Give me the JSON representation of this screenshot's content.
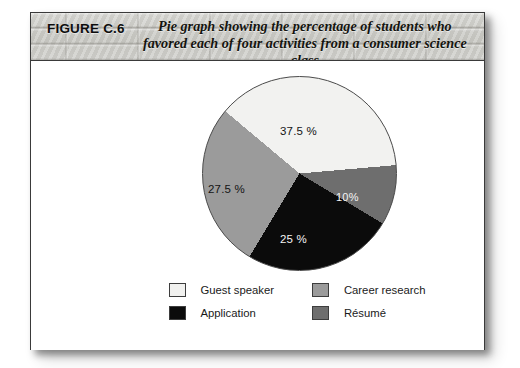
{
  "figure": {
    "number_label": "FIGURE C.6",
    "caption": "Pie graph showing the percentage of students who favored each of four activities from a consumer science class"
  },
  "chart_data": {
    "type": "pie",
    "title": "Pie graph showing the percentage of students who favored each of four activities from a consumer science class",
    "categories": [
      "Guest speaker",
      "Career research",
      "Application",
      "Résumé"
    ],
    "values": [
      37.5,
      27.5,
      25,
      10
    ],
    "value_labels": [
      "37.5 %",
      "27.5 %",
      "25 %",
      "10%"
    ],
    "unit": "%",
    "legend_position": "bottom",
    "grid": false,
    "colors": [
      "#f2f2f0",
      "#9b9b9b",
      "#0b0b0b",
      "#6e6e6e"
    ],
    "start_angle_deg": -50,
    "direction": "clockwise"
  },
  "legend": {
    "items": [
      {
        "label": "Guest speaker",
        "color": "#f1f1ef"
      },
      {
        "label": "Career research",
        "color": "#9b9b9b"
      },
      {
        "label": "Application",
        "color": "#0b0b0b"
      },
      {
        "label": "Résumé",
        "color": "#6e6e6e"
      }
    ]
  }
}
